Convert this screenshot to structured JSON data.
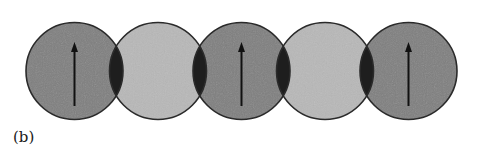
{
  "figure": {
    "panel_label": "(b)",
    "colors": {
      "dark_sphere": "#7f7f7f",
      "light_sphere": "#b8b8b8",
      "overlap": "#1e1e1e",
      "outline": "#2a2a2a",
      "arrow": "#111111"
    },
    "geometry": {
      "center_y": 71,
      "radius": 48.5,
      "centers_x": [
        74.5,
        158,
        241.5,
        325,
        408.5
      ]
    },
    "spheres": [
      {
        "id": 1,
        "shade": "dark",
        "arrow": "up"
      },
      {
        "id": 2,
        "shade": "light",
        "arrow": "none"
      },
      {
        "id": 3,
        "shade": "dark",
        "arrow": "up"
      },
      {
        "id": 4,
        "shade": "light",
        "arrow": "none"
      },
      {
        "id": 5,
        "shade": "dark",
        "arrow": "up"
      }
    ],
    "overlaps": [
      {
        "between": [
          1,
          2
        ]
      },
      {
        "between": [
          2,
          3
        ]
      },
      {
        "between": [
          3,
          4
        ]
      },
      {
        "between": [
          4,
          5
        ]
      }
    ]
  }
}
